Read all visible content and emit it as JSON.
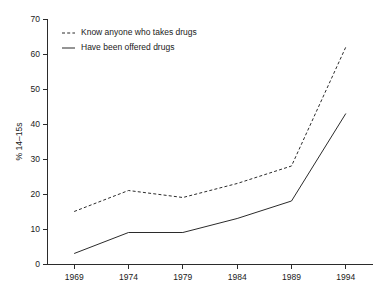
{
  "chart_data": {
    "type": "line",
    "title": "",
    "xlabel": "",
    "ylabel": "% 14–15s",
    "x": [
      1969,
      1974,
      1979,
      1984,
      1989,
      1994
    ],
    "xticklabels": [
      "1969",
      "1974",
      "1979",
      "1984",
      "1989",
      "1994"
    ],
    "yticklabels": [
      "0",
      "10",
      "20",
      "30",
      "40",
      "50",
      "60",
      "70"
    ],
    "yticks": [
      0,
      10,
      20,
      30,
      40,
      50,
      60,
      70
    ],
    "ylim": [
      0,
      70
    ],
    "xlim": [
      1966.5,
      1996.5
    ],
    "grid": false,
    "legend_position": "top-left",
    "series": [
      {
        "name": "Know anyone who takes drugs",
        "style": "dashed",
        "color": "#2b2b2b",
        "values": [
          15,
          21,
          19,
          23,
          28,
          62
        ]
      },
      {
        "name": "Have been offered drugs",
        "style": "solid",
        "color": "#2b2b2b",
        "values": [
          3,
          9,
          9,
          13,
          18,
          43
        ]
      }
    ]
  }
}
